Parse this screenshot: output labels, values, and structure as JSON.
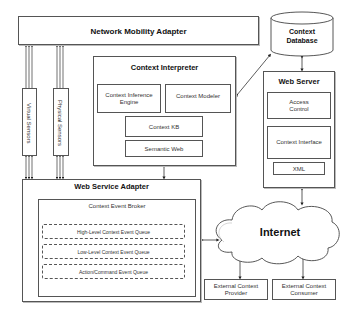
{
  "diagram": {
    "network_mobility_adapter": "Network Mobility Adapter",
    "context_database": "Context Database",
    "context_interpreter": {
      "title": "Context Interpreter",
      "inference_engine": "Context Inference Engine",
      "modeler": "Context Modeler",
      "kb": "Context KB",
      "semantic_web": "Semantic Web"
    },
    "web_server": {
      "title": "Web Server",
      "access_control": "Access Control",
      "context_interface": "Context Interface",
      "xml": "XML"
    },
    "sensors": {
      "virtual": "Virtual Sensors",
      "physical": "Physical Sensors"
    },
    "web_service_adapter": {
      "title": "Web Service Adapter",
      "broker": "Context Event Broker",
      "queues": [
        "High-Level Context Event Queue",
        "Low-Level Context Event Queue",
        "Action/Command Event Queue"
      ]
    },
    "internet": "Internet",
    "external_provider": "External Context Provider",
    "external_consumer": "External Context Consumer"
  }
}
